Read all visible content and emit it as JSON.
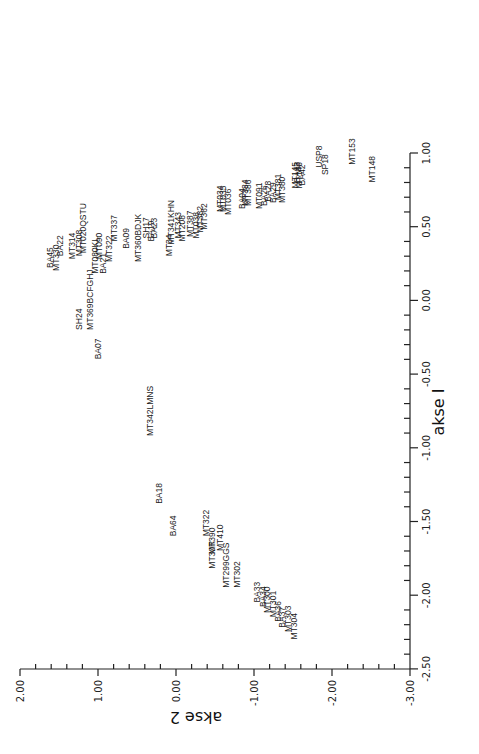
{
  "chart_data": {
    "type": "scatter",
    "title": "",
    "orientation_note": "figure printed rotated 90 degrees; labels read bottom-to-top",
    "xlabel": "akse 2",
    "ylabel": "akse I",
    "x_axis": {
      "label": "akse 2",
      "range": [
        2.0,
        -3.0
      ],
      "ticks": [
        "2.00",
        "1.00",
        "0.00",
        "-1.00",
        "-2.00",
        "-3.00"
      ],
      "tick_values": [
        2.0,
        1.0,
        0.0,
        -1.0,
        -2.0,
        -3.0
      ]
    },
    "y_axis": {
      "label": "akse I",
      "range": [
        1.0,
        -2.5
      ],
      "ticks": [
        "1.00",
        "0.50",
        "0.00",
        "-0.50",
        "-1.00",
        "-1.50",
        "-2.00",
        "-2.50"
      ],
      "tick_values": [
        1.0,
        0.5,
        0.0,
        -0.5,
        -1.0,
        -1.5,
        -2.0,
        -2.5
      ]
    },
    "grid": false,
    "legend": null,
    "points": [
      {
        "label": "MT148",
        "akse1": 0.8,
        "akse2": -2.55
      },
      {
        "label": "MT153",
        "akse1": 0.92,
        "akse2": -2.3
      },
      {
        "label": "SP18",
        "akse1": 0.85,
        "akse2": -1.95
      },
      {
        "label": "USP8",
        "akse1": 0.9,
        "akse2": -1.87
      },
      {
        "label": "BA42",
        "akse1": 0.78,
        "akse2": -1.65
      },
      {
        "label": "BA43",
        "akse1": 0.8,
        "akse2": -1.59
      },
      {
        "label": "MT146",
        "akse1": 0.76,
        "akse2": -1.62
      },
      {
        "label": "MT145",
        "akse1": 0.76,
        "akse2": -1.56
      },
      {
        "label": "MT380",
        "akse1": 0.66,
        "akse2": -1.4
      },
      {
        "label": "MT381",
        "akse1": 0.68,
        "akse2": -1.35
      },
      {
        "label": "BA29",
        "akse1": 0.66,
        "akse2": -1.28
      },
      {
        "label": "BA28",
        "akse1": 0.67,
        "akse2": -1.22
      },
      {
        "label": "BA26",
        "akse1": 0.64,
        "akse2": -1.17
      },
      {
        "label": "MT091",
        "akse1": 0.62,
        "akse2": -1.1
      },
      {
        "label": "MT386",
        "akse1": 0.64,
        "akse2": -0.96
      },
      {
        "label": "MT384",
        "akse1": 0.64,
        "akse2": -0.92
      },
      {
        "label": "BA04",
        "akse1": 0.62,
        "akse2": -0.88
      },
      {
        "label": "MT036",
        "akse1": 0.58,
        "akse2": -0.7
      },
      {
        "label": "MT035",
        "akse1": 0.6,
        "akse2": -0.64
      },
      {
        "label": "MT034",
        "akse1": 0.6,
        "akse2": -0.6
      },
      {
        "label": "MT362",
        "akse1": 0.48,
        "akse2": -0.4
      },
      {
        "label": "MT382",
        "akse1": 0.46,
        "akse2": -0.35
      },
      {
        "label": "MT038",
        "akse1": 0.42,
        "akse2": -0.3
      },
      {
        "label": "MT387",
        "akse1": 0.43,
        "akse2": -0.22
      },
      {
        "label": "MT208",
        "akse1": 0.4,
        "akse2": -0.12
      },
      {
        "label": "MT343",
        "akse1": 0.42,
        "akse2": -0.06
      },
      {
        "label": "MT341KHN",
        "akse1": 0.38,
        "akse2": 0.02
      },
      {
        "label": "MT34",
        "akse1": 0.3,
        "akse2": 0.05
      },
      {
        "label": "BA23",
        "akse1": 0.42,
        "akse2": 0.24
      },
      {
        "label": "BA19",
        "akse1": 0.4,
        "akse2": 0.28
      },
      {
        "label": "SH17",
        "akse1": 0.42,
        "akse2": 0.35
      },
      {
        "label": "MT360BDJK",
        "akse1": 0.26,
        "akse2": 0.45
      },
      {
        "label": "BA09",
        "akse1": 0.35,
        "akse2": 0.6
      },
      {
        "label": "MT337",
        "akse1": 0.4,
        "akse2": 0.76
      },
      {
        "label": "MT322",
        "akse1": 0.26,
        "akse2": 0.82
      },
      {
        "label": "MT080KL",
        "akse1": 0.18,
        "akse2": 1.0
      },
      {
        "label": "BA21",
        "akse1": 0.18,
        "akse2": 0.9
      },
      {
        "label": "MT369BCFGHJ",
        "akse1": -0.2,
        "akse2": 1.06
      },
      {
        "label": "MT090",
        "akse1": 0.28,
        "akse2": 0.95
      },
      {
        "label": "MT020QSTU",
        "akse1": 0.32,
        "akse2": 1.15
      },
      {
        "label": "MT308",
        "akse1": 0.3,
        "akse2": 1.2
      },
      {
        "label": "MT314",
        "akse1": 0.28,
        "akse2": 1.3
      },
      {
        "label": "BA22",
        "akse1": 0.3,
        "akse2": 1.45
      },
      {
        "label": "BA45",
        "akse1": 0.22,
        "akse2": 1.58
      },
      {
        "label": "MT330",
        "akse1": 0.2,
        "akse2": 1.5
      },
      {
        "label": "SH24",
        "akse1": -0.2,
        "akse2": 1.2
      },
      {
        "label": "BA07",
        "akse1": -0.4,
        "akse2": 0.96
      },
      {
        "label": "MT342LMNS",
        "akse1": -0.92,
        "akse2": 0.3
      },
      {
        "label": "BA18",
        "akse1": -1.38,
        "akse2": 0.18
      },
      {
        "label": "BA64",
        "akse1": -1.6,
        "akse2": 0.0
      },
      {
        "label": "MT322",
        "akse1": -1.6,
        "akse2": -0.42
      },
      {
        "label": "MT410",
        "akse1": -1.7,
        "akse2": -0.6
      },
      {
        "label": "MT30R",
        "akse1": -1.82,
        "akse2": -0.5
      },
      {
        "label": "MT390",
        "akse1": -1.72,
        "akse2": -0.5
      },
      {
        "label": "MT299GGS",
        "akse1": -1.95,
        "akse2": -0.68
      },
      {
        "label": "MT302",
        "akse1": -1.95,
        "akse2": -0.82
      },
      {
        "label": "BA33",
        "akse1": -2.05,
        "akse2": -1.08
      },
      {
        "label": "BA34",
        "akse1": -2.08,
        "akse2": -1.15
      },
      {
        "label": "MT300",
        "akse1": -2.12,
        "akse2": -1.2
      },
      {
        "label": "MT301",
        "akse1": -2.15,
        "akse2": -1.28
      },
      {
        "label": "BA36",
        "akse1": -2.18,
        "akse2": -1.35
      },
      {
        "label": "BA37",
        "akse1": -2.22,
        "akse2": -1.4
      },
      {
        "label": "MT303",
        "akse1": -2.25,
        "akse2": -1.48
      },
      {
        "label": "MT304",
        "akse1": -2.3,
        "akse2": -1.55
      }
    ]
  }
}
